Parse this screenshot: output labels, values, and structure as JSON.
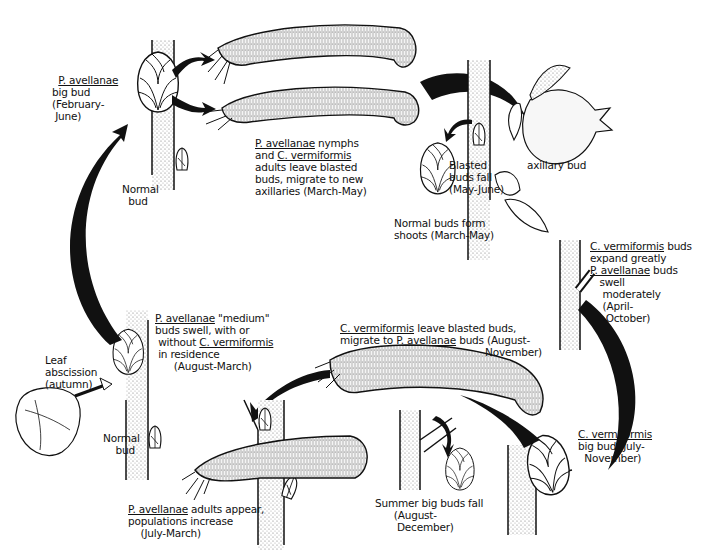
{
  "figure": {
    "type": "life-cycle diagram"
  },
  "labels": {
    "pav_big_bud": {
      "species": "P. avellanae",
      "rest": "big bud\n(February-\n June)"
    },
    "normal_bud_top": {
      "text": "Normal\n  bud"
    },
    "nymphs_leave": {
      "species1": "P. avellanae",
      "text1": " nymphs",
      "line2a": "and ",
      "species2": "C. vermiformis",
      "text2": "adults leave blasted\nbuds, migrate to new\naxillaries (March-May)"
    },
    "blasted_fall": {
      "text": "Blasted\nbuds fall\n(May-June)"
    },
    "axillary_bud": {
      "text": "axillary bud"
    },
    "normal_shoots": {
      "text": "Normal buds form\nshoots (March-May)"
    },
    "cv_expand": {
      "species1": "C. vermiformis",
      "text1": " buds",
      "line2": "expand greatly",
      "species2": "P. avellanae",
      "text2": " buds",
      "rest": "   swell\n    moderately\n    (April-\n     October)"
    },
    "cv_leave": {
      "species1": "C. vermiformis",
      "text1": " leave blasted buds,",
      "line2a": "migrate to ",
      "species2": "P. avellanae",
      "text2": " buds (August-",
      "line3": "November)"
    },
    "cv_big_bud": {
      "species": "C. vermiformis",
      "rest": "big bud (July-\n  November)"
    },
    "summer_fall": {
      "text": "Summer big buds fall\n      (August-\n       December)"
    },
    "pav_adults": {
      "species": "P. avellanae",
      "text1": " adults appear,",
      "rest": "populations increase\n    (July-March)"
    },
    "pav_medium": {
      "species1": "P. avellanae",
      "text1": " \"medium\"",
      "line2": "buds swell, with or",
      "line3a": " without ",
      "species2": "C. vermiformis",
      "rest": " in residence\n      (August-March)"
    },
    "normal_bud_bottom": {
      "text": "Normal\n    bud"
    },
    "leaf_abscission": {
      "text": "Leaf\nabscission\n(autumn)"
    }
  },
  "colors": {
    "ink": "#111111",
    "paper": "#ffffff",
    "stipple": "#888888"
  }
}
